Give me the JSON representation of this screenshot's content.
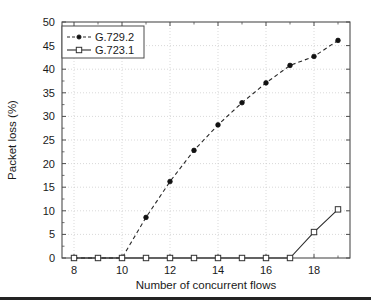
{
  "chart_data": {
    "type": "line",
    "title": "",
    "xlabel": "Number of concurrent flows",
    "ylabel": "Packet loss (%)",
    "xlim": [
      7.5,
      19.5
    ],
    "ylim": [
      0,
      50
    ],
    "xticks": [
      8,
      9,
      10,
      11,
      12,
      13,
      14,
      15,
      16,
      17,
      18,
      19
    ],
    "xtick_labels": [
      "8",
      "",
      "10",
      "",
      "12",
      "",
      "14",
      "",
      "16",
      "",
      "18",
      ""
    ],
    "yticks": [
      0,
      5,
      10,
      15,
      20,
      25,
      30,
      35,
      40,
      45,
      50
    ],
    "ytick_labels": [
      "0",
      "5",
      "10",
      "15",
      "20",
      "25",
      "30",
      "35",
      "40",
      "45",
      "50"
    ],
    "grid": true,
    "legend_position": "upper left",
    "x": [
      8,
      9,
      10,
      11,
      12,
      13,
      14,
      15,
      16,
      17,
      18,
      19
    ],
    "series": [
      {
        "name": "G.729.2",
        "linestyle": "dashed",
        "marker": "filled-circle",
        "color": "#111111",
        "values": [
          0,
          0,
          0,
          8.6,
          16.2,
          22.8,
          28.2,
          32.9,
          37.1,
          40.8,
          42.7,
          46.1
        ]
      },
      {
        "name": "G.723.1",
        "linestyle": "solid",
        "marker": "open-square",
        "color": "#333333",
        "values": [
          0,
          0,
          0,
          0,
          0,
          0,
          0,
          0,
          0,
          0,
          5.5,
          10.3
        ]
      }
    ]
  },
  "legend": {
    "entries": [
      {
        "label": "G.729.2"
      },
      {
        "label": "G.723.1"
      }
    ]
  },
  "axes": {
    "x_title": "Number of concurrent flows",
    "y_title": "Packet loss (%)"
  },
  "colors": {
    "series_primary": "#111111",
    "series_secondary": "#333333",
    "frame": "#4d4d4d",
    "grid": "#c8c8c8",
    "rule": "#232323"
  }
}
